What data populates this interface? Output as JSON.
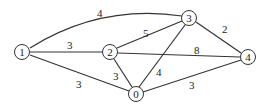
{
  "graph": {
    "nodes": [
      {
        "id": "0",
        "label": "0",
        "x": 136,
        "y": 94
      },
      {
        "id": "1",
        "label": "1",
        "x": 22,
        "y": 52
      },
      {
        "id": "2",
        "label": "2",
        "x": 110,
        "y": 52
      },
      {
        "id": "3",
        "label": "3",
        "x": 189,
        "y": 18
      },
      {
        "id": "4",
        "label": "4",
        "x": 248,
        "y": 57
      }
    ],
    "edges": [
      {
        "from": "1",
        "to": "3",
        "weight": "4",
        "label_x": 100,
        "label_y": 18
      },
      {
        "from": "1",
        "to": "2",
        "weight": "3",
        "label_x": 70,
        "label_y": 49
      },
      {
        "from": "1",
        "to": "0",
        "weight": "3",
        "label_x": 79,
        "label_y": 88
      },
      {
        "from": "2",
        "to": "3",
        "weight": "5",
        "label_x": 145,
        "label_y": 37
      },
      {
        "from": "2",
        "to": "4",
        "weight": "8",
        "label_x": 196,
        "label_y": 54
      },
      {
        "from": "2",
        "to": "0",
        "weight": "3",
        "label_x": 116,
        "label_y": 79
      },
      {
        "from": "3",
        "to": "0",
        "weight": "4",
        "label_x": 158,
        "label_y": 75
      },
      {
        "from": "3",
        "to": "4",
        "weight": "2",
        "label_x": 224,
        "label_y": 33
      },
      {
        "from": "0",
        "to": "4",
        "weight": "3",
        "label_x": 191,
        "label_y": 89
      }
    ]
  }
}
